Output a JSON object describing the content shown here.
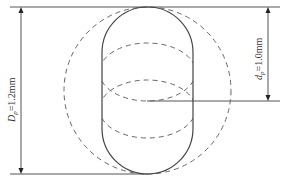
{
  "diagram": {
    "labels": {
      "outer_dimension": {
        "symbol": "D",
        "subscript": "p",
        "value": "=1.2mm"
      },
      "inner_dimension": {
        "symbol": "d",
        "subscript": "p",
        "value": "=1.0mm"
      }
    },
    "colors": {
      "line": "#555555",
      "background": "#ffffff"
    }
  }
}
